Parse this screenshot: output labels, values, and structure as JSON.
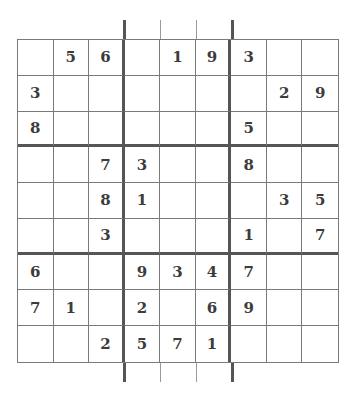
{
  "puzzle": {
    "type": "sudoku",
    "size": 9,
    "grid": [
      [
        "",
        "5",
        "6",
        "",
        "1",
        "9",
        "3",
        "",
        ""
      ],
      [
        "3",
        "",
        "",
        "",
        "",
        "",
        "",
        "2",
        "9"
      ],
      [
        "8",
        "",
        "",
        "",
        "",
        "",
        "5",
        "",
        ""
      ],
      [
        "",
        "",
        "7",
        "3",
        "",
        "",
        "8",
        "",
        ""
      ],
      [
        "",
        "",
        "8",
        "1",
        "",
        "",
        "",
        "3",
        "5"
      ],
      [
        "",
        "",
        "3",
        "",
        "",
        "",
        "1",
        "",
        "7"
      ],
      [
        "6",
        "",
        "",
        "9",
        "3",
        "4",
        "7",
        "",
        ""
      ],
      [
        "7",
        "1",
        "",
        "2",
        "",
        "6",
        "9",
        "",
        ""
      ],
      [
        "",
        "",
        "2",
        "5",
        "7",
        "1",
        "",
        "",
        ""
      ]
    ]
  },
  "colors": {
    "digit": "#3c3c3c",
    "thin_line": "#7a7a7a",
    "thick_line": "#555555",
    "background": "#ffffff"
  }
}
